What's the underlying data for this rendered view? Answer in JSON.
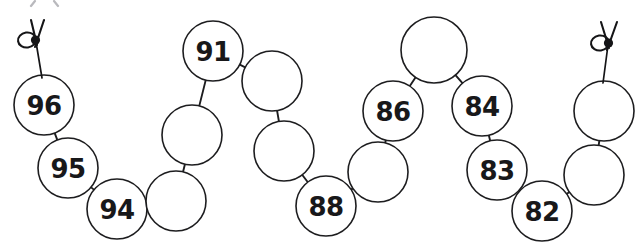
{
  "figure": {
    "name": "bead-chain-number-line",
    "background_color": "#ffffff",
    "stroke_color": "#1d1d1f",
    "label_color": "#18181a",
    "bead_radius": 30,
    "corner_mark_hint": "(a)",
    "beads": [
      {
        "id": "bead-1",
        "label": "96",
        "cx": 44,
        "cy": 105,
        "r": 30
      },
      {
        "id": "bead-2",
        "label": "95",
        "cx": 68,
        "cy": 168,
        "r": 30
      },
      {
        "id": "bead-3",
        "label": "94",
        "cx": 117,
        "cy": 209,
        "r": 30
      },
      {
        "id": "bead-4",
        "label": "",
        "cx": 176,
        "cy": 201,
        "r": 30
      },
      {
        "id": "bead-5",
        "label": "",
        "cx": 192,
        "cy": 135,
        "r": 30
      },
      {
        "id": "bead-6",
        "label": "91",
        "cx": 213,
        "cy": 51,
        "r": 30
      },
      {
        "id": "bead-7",
        "label": "",
        "cx": 272,
        "cy": 81,
        "r": 30
      },
      {
        "id": "bead-8",
        "label": "",
        "cx": 284,
        "cy": 151,
        "r": 30
      },
      {
        "id": "bead-9",
        "label": "88",
        "cx": 326,
        "cy": 206,
        "r": 30
      },
      {
        "id": "bead-10",
        "label": "",
        "cx": 378,
        "cy": 172,
        "r": 30
      },
      {
        "id": "bead-11",
        "label": "86",
        "cx": 393,
        "cy": 111,
        "r": 30
      },
      {
        "id": "bead-12",
        "label": "",
        "cx": 434,
        "cy": 50,
        "r": 33
      },
      {
        "id": "bead-13",
        "label": "84",
        "cx": 482,
        "cy": 106,
        "r": 30
      },
      {
        "id": "bead-14",
        "label": "83",
        "cx": 497,
        "cy": 170,
        "r": 30
      },
      {
        "id": "bead-15",
        "label": "82",
        "cx": 542,
        "cy": 211,
        "r": 30
      },
      {
        "id": "bead-16",
        "label": "",
        "cx": 594,
        "cy": 175,
        "r": 30
      },
      {
        "id": "bead-17",
        "label": "",
        "cx": 604,
        "cy": 111,
        "r": 30
      }
    ],
    "links": [
      {
        "from": "bead-1",
        "to": "bead-2"
      },
      {
        "from": "bead-2",
        "to": "bead-3"
      },
      {
        "from": "bead-3",
        "to": "bead-4"
      },
      {
        "from": "bead-4",
        "to": "bead-5"
      },
      {
        "from": "bead-5",
        "to": "bead-6"
      },
      {
        "from": "bead-6",
        "to": "bead-7"
      },
      {
        "from": "bead-7",
        "to": "bead-8"
      },
      {
        "from": "bead-8",
        "to": "bead-9"
      },
      {
        "from": "bead-9",
        "to": "bead-10"
      },
      {
        "from": "bead-10",
        "to": "bead-11"
      },
      {
        "from": "bead-11",
        "to": "bead-12"
      },
      {
        "from": "bead-12",
        "to": "bead-13"
      },
      {
        "from": "bead-13",
        "to": "bead-14"
      },
      {
        "from": "bead-14",
        "to": "bead-15"
      },
      {
        "from": "bead-15",
        "to": "bead-16"
      },
      {
        "from": "bead-16",
        "to": "bead-17"
      }
    ],
    "end_knots": [
      {
        "id": "knot-left",
        "x": 30,
        "y": 40,
        "attach_bead": "bead-1"
      },
      {
        "id": "knot-right",
        "x": 605,
        "y": 42,
        "attach_bead": "bead-17"
      }
    ]
  }
}
